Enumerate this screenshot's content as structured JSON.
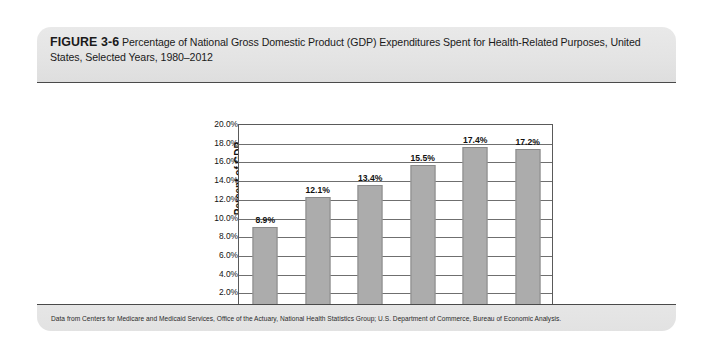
{
  "figure": {
    "number_label": "FIGURE 3-6",
    "caption": "Percentage of National Gross Domestic Product (GDP) Expenditures Spent for Health-Related Purposes, United States, Selected Years, 1980–2012",
    "source_note": "Data from Centers for Medicare and Medicaid Services, Office of the Actuary, National Health Statistics Group; U.S. Department of Commerce, Bureau of Economic Analysis."
  },
  "colors": {
    "bar_fill": "#acacac",
    "bar_border": "#8a8a8a",
    "header_band": "#e4e4e4",
    "footer_band": "#e2e2e2",
    "card_border": "#4a4a4a",
    "axis_line": "#5a5a5a",
    "gridline": "#6f6f6f",
    "text": "#111111"
  },
  "chart_data": {
    "type": "bar",
    "title": "",
    "xlabel": "",
    "ylabel": "Percent of GDP",
    "categories": [
      "1980",
      "1990",
      "2000",
      "2005",
      "2010",
      "2012"
    ],
    "values": [
      8.9,
      12.1,
      13.4,
      15.5,
      17.4,
      17.2
    ],
    "value_labels": [
      "8.9%",
      "12.1%",
      "13.4%",
      "15.5%",
      "17.4%",
      "17.2%"
    ],
    "ylim": [
      0.0,
      20.0
    ],
    "ytick_values": [
      20.0,
      18.0,
      16.0,
      14.0,
      12.0,
      10.0,
      8.0,
      6.0,
      4.0,
      2.0,
      0.0
    ],
    "ytick_labels": [
      "20.0%",
      "18.0%",
      "16.0%",
      "14.0%",
      "12.0%",
      "10.0%",
      "8.0%",
      "6.0%",
      "4.0%",
      "2.0%",
      "0.0%"
    ],
    "grid": true,
    "legend": false,
    "legend_position": "none"
  }
}
